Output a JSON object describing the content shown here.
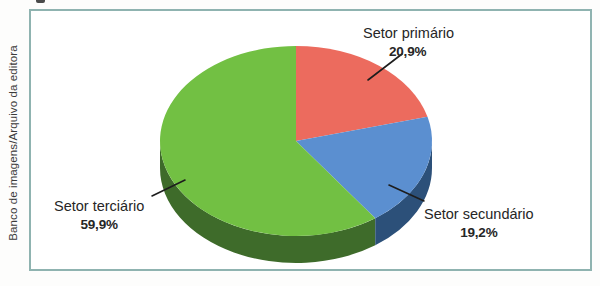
{
  "credit": {
    "text": "Banco de imagens/Arquivo da editora"
  },
  "figure": {
    "frame_border_color": "#8fb3b0",
    "background_color": "#ffffff"
  },
  "chart_data": {
    "type": "pie",
    "title": "",
    "subtitle": "",
    "xlabel": "",
    "ylabel": "",
    "legend_position": "callout-labels",
    "grid": false,
    "three_d": true,
    "start_angle_deg": 0,
    "direction": "clockwise",
    "categories": [
      "Setor primário",
      "Setor secundário",
      "Setor terciário"
    ],
    "values": [
      20.9,
      19.2,
      59.9
    ],
    "value_suffix": "%",
    "colors": [
      "#ec6b5e",
      "#5b8fd0",
      "#72c043"
    ],
    "side_colors": [
      "#a8413a",
      "#2c5079",
      "#3e6b2a"
    ],
    "slices": [
      {
        "name": "Setor primário",
        "label": "Setor primário",
        "value": 20.9,
        "value_text": "20,9%",
        "color": "#ec6b5e",
        "side_color": "#a8413a"
      },
      {
        "name": "Setor secundário",
        "label": "Setor secundário",
        "value": 19.2,
        "value_text": "19,2%",
        "color": "#5b8fd0",
        "side_color": "#2c5079"
      },
      {
        "name": "Setor terciário",
        "label": "Setor terciário",
        "value": 59.9,
        "value_text": "59,9%",
        "color": "#72c043",
        "side_color": "#3e6b2a"
      }
    ]
  },
  "labels": {
    "primario": {
      "name": "Setor primário",
      "value_text": "20,9%"
    },
    "secundario": {
      "name": "Setor secundário",
      "value_text": "19,2%"
    },
    "terciario": {
      "name": "Setor terciário",
      "value_text": "59,9%"
    }
  }
}
